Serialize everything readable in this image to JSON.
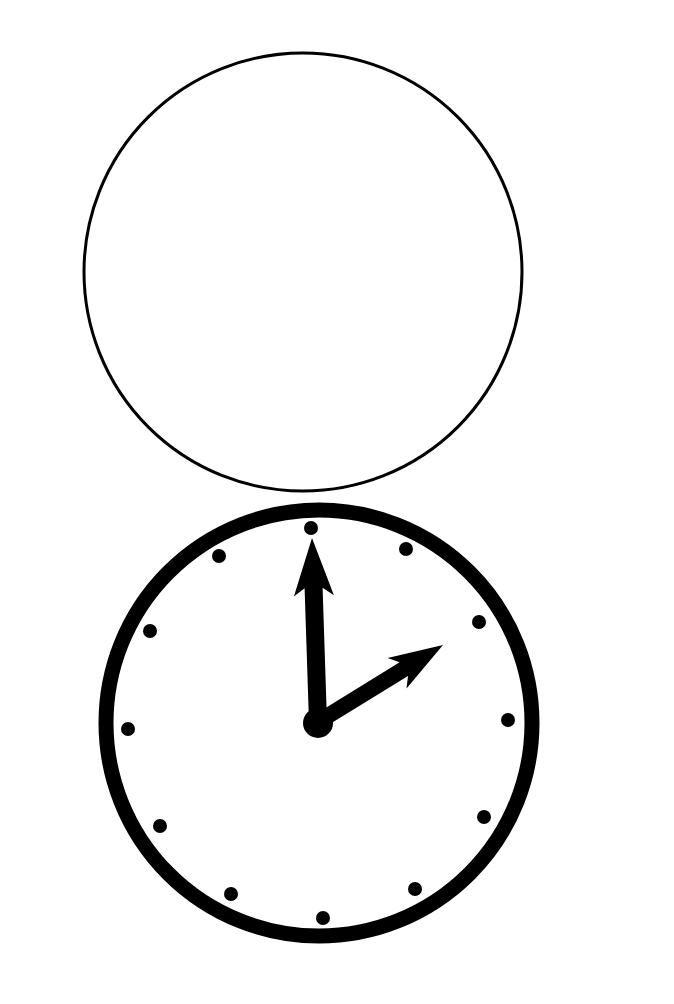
{
  "figure": {
    "colors": {
      "background": "#ffffff",
      "ink": "#000000"
    }
  },
  "blank_circle": {
    "cx": 303,
    "cy": 272,
    "r": 219,
    "stroke_width": 3,
    "label": "empty clock face for answer"
  },
  "clock": {
    "time_shown": "2:00",
    "hour": 2,
    "minute": 0,
    "face": {
      "cx": 319,
      "cy": 723,
      "r": 213,
      "stroke_width": 15
    },
    "hub": {
      "cx": 318,
      "cy": 723,
      "r": 15
    },
    "hour_markers": [
      {
        "hour": 12,
        "x": 311,
        "y": 528
      },
      {
        "hour": 1,
        "x": 406,
        "y": 549
      },
      {
        "hour": 2,
        "x": 479,
        "y": 622
      },
      {
        "hour": 3,
        "x": 508,
        "y": 720
      },
      {
        "hour": 4,
        "x": 484,
        "y": 817
      },
      {
        "hour": 5,
        "x": 415,
        "y": 889
      },
      {
        "hour": 6,
        "x": 323,
        "y": 918
      },
      {
        "hour": 7,
        "x": 231,
        "y": 894
      },
      {
        "hour": 8,
        "x": 160,
        "y": 826
      },
      {
        "hour": 9,
        "x": 128,
        "y": 729
      },
      {
        "hour": 10,
        "x": 150,
        "y": 631
      },
      {
        "hour": 11,
        "x": 219,
        "y": 556
      }
    ],
    "marker_radius": 7,
    "minute_hand": {
      "from": [
        318,
        722
      ],
      "to": [
        312,
        538
      ],
      "width": 18
    },
    "hour_hand": {
      "from": [
        318,
        722
      ],
      "to": [
        443,
        645
      ],
      "width": 16
    }
  }
}
